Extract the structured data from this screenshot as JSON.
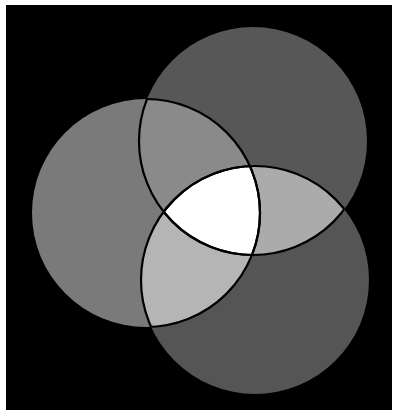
{
  "diagram": {
    "type": "venn-3",
    "background_color": "#000000",
    "border_color": "#ffffff",
    "circles": [
      {
        "id": "top",
        "cx": 253,
        "cy": 141,
        "r": 114,
        "fill": "#575757"
      },
      {
        "id": "left",
        "cx": 146,
        "cy": 213,
        "r": 114,
        "fill": "#7a7a7a"
      },
      {
        "id": "bottom",
        "cx": 255,
        "cy": 280,
        "r": 114,
        "fill": "#555555"
      }
    ],
    "overlaps": {
      "top_left": "#8a8a8a",
      "top_bottom": "#ababab",
      "left_bottom": "#b5b5b5",
      "all_three": "#ffffff"
    },
    "outline_color": "#000000"
  }
}
